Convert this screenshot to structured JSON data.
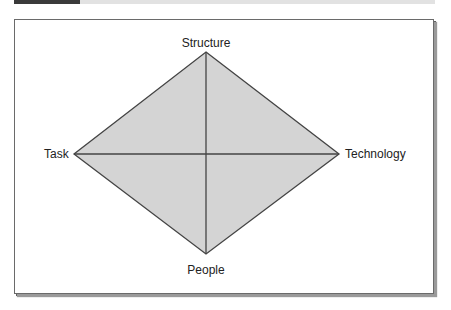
{
  "diagram": {
    "type": "diamond",
    "nodes": {
      "top": {
        "label": "Structure"
      },
      "left": {
        "label": "Task"
      },
      "right": {
        "label": "Technology"
      },
      "bottom": {
        "label": "People"
      }
    },
    "edges": [
      [
        "Structure",
        "Technology"
      ],
      [
        "Technology",
        "People"
      ],
      [
        "People",
        "Task"
      ],
      [
        "Task",
        "Structure"
      ],
      [
        "Structure",
        "People"
      ],
      [
        "Task",
        "Technology"
      ]
    ],
    "colors": {
      "fill": "#d4d4d4",
      "stroke": "#444444",
      "header_dark": "#3a3a3a",
      "header_light": "#e2e2e2"
    }
  }
}
